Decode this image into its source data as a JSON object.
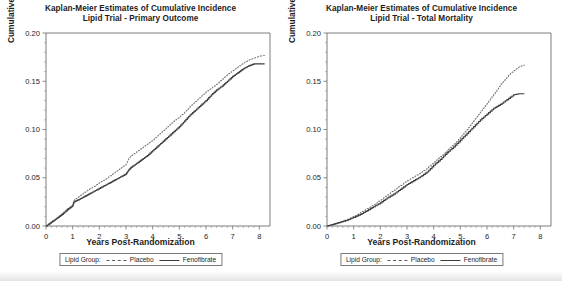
{
  "figure": {
    "panels": [
      {
        "id": "primary-outcome",
        "title_line1": "Kaplan-Meier Estimates of Cumulative Incidence",
        "title_line2": "Lipid Trial - Primary Outcome",
        "xlabel": "Years Post-Randomization",
        "ylabel": "Cumulative Incidence",
        "legend": {
          "title": "Lipid Group:",
          "entries": [
            {
              "label": "Placebo",
              "style": "dashed"
            },
            {
              "label": "Fenofibrate",
              "style": "solid"
            }
          ]
        }
      },
      {
        "id": "total-mortality",
        "title_line1": "Kaplan-Meier Estimates of Cumulative Incidence",
        "title_line2": "Lipid Trial - Total Mortality",
        "xlabel": "Years Post-Randomization",
        "ylabel": "Cumulative Incidence",
        "legend": {
          "title": "Lipid Group:",
          "entries": [
            {
              "label": "Placebo",
              "style": "dashed"
            },
            {
              "label": "Fenofibrate",
              "style": "solid"
            }
          ]
        }
      }
    ]
  },
  "chart_data": [
    {
      "type": "line",
      "id": "primary-outcome",
      "title": "Kaplan-Meier Estimates of Cumulative Incidence / Lipid Trial - Primary Outcome",
      "xlabel": "Years Post-Randomization",
      "ylabel": "Cumulative Incidence",
      "xlim": [
        0,
        8.4
      ],
      "ylim": [
        0,
        0.2
      ],
      "xticks": [
        0,
        1,
        2,
        3,
        4,
        5,
        6,
        7,
        8
      ],
      "yticks": [
        0.0,
        0.05,
        0.1,
        0.15,
        0.2
      ],
      "ytick_labels": [
        "0.00",
        "0.05",
        "0.10",
        "0.15",
        "0.20"
      ],
      "xtick_labels": [
        "0",
        "1",
        "2",
        "3",
        "4",
        "5",
        "6",
        "7",
        "8"
      ],
      "grid": false,
      "legend_position": "below-axes",
      "step": "post",
      "series": [
        {
          "name": "Placebo",
          "style": "dashed",
          "color": "#6a6a6a",
          "x": [
            0,
            0.2,
            0.4,
            0.6,
            0.8,
            1.0,
            1.05,
            1.2,
            1.4,
            1.6,
            1.8,
            2.0,
            2.2,
            2.4,
            2.6,
            2.8,
            3.0,
            3.1,
            3.2,
            3.4,
            3.6,
            3.8,
            4.0,
            4.2,
            4.4,
            4.6,
            4.8,
            5.0,
            5.2,
            5.4,
            5.6,
            5.8,
            6.0,
            6.2,
            6.4,
            6.6,
            6.8,
            7.0,
            7.2,
            7.4,
            7.6,
            7.8,
            8.0,
            8.2
          ],
          "y": [
            0.0,
            0.004,
            0.008,
            0.013,
            0.018,
            0.022,
            0.027,
            0.03,
            0.034,
            0.038,
            0.041,
            0.045,
            0.048,
            0.052,
            0.056,
            0.06,
            0.064,
            0.07,
            0.073,
            0.077,
            0.081,
            0.085,
            0.089,
            0.094,
            0.099,
            0.104,
            0.109,
            0.113,
            0.118,
            0.124,
            0.129,
            0.134,
            0.139,
            0.143,
            0.147,
            0.152,
            0.157,
            0.161,
            0.165,
            0.169,
            0.172,
            0.174,
            0.176,
            0.177
          ]
        },
        {
          "name": "Fenofibrate",
          "style": "solid",
          "color": "#3c3c3c",
          "x": [
            0,
            0.2,
            0.4,
            0.6,
            0.8,
            1.0,
            1.05,
            1.2,
            1.4,
            1.6,
            1.8,
            2.0,
            2.2,
            2.4,
            2.6,
            2.8,
            3.0,
            3.1,
            3.2,
            3.4,
            3.6,
            3.8,
            4.0,
            4.2,
            4.4,
            4.6,
            4.8,
            5.0,
            5.2,
            5.4,
            5.6,
            5.8,
            6.0,
            6.2,
            6.4,
            6.6,
            6.8,
            7.0,
            7.2,
            7.4,
            7.6,
            7.8,
            8.0,
            8.2
          ],
          "y": [
            0.0,
            0.004,
            0.008,
            0.012,
            0.017,
            0.021,
            0.025,
            0.027,
            0.03,
            0.033,
            0.036,
            0.039,
            0.042,
            0.045,
            0.048,
            0.051,
            0.054,
            0.058,
            0.061,
            0.065,
            0.069,
            0.073,
            0.078,
            0.083,
            0.088,
            0.093,
            0.098,
            0.103,
            0.109,
            0.115,
            0.12,
            0.125,
            0.13,
            0.136,
            0.141,
            0.145,
            0.15,
            0.155,
            0.159,
            0.163,
            0.166,
            0.168,
            0.168,
            0.168
          ]
        }
      ]
    },
    {
      "type": "line",
      "id": "total-mortality",
      "title": "Kaplan-Meier Estimates of Cumulative Incidence / Lipid Trial - Total Mortality",
      "xlabel": "Years Post-Randomization",
      "ylabel": "Cumulative Incidence",
      "xlim": [
        0,
        8.4
      ],
      "ylim": [
        0,
        0.2
      ],
      "xticks": [
        0,
        1,
        2,
        3,
        4,
        5,
        6,
        7,
        8
      ],
      "yticks": [
        0.0,
        0.05,
        0.1,
        0.15,
        0.2
      ],
      "ytick_labels": [
        "0.00",
        "0.05",
        "0.10",
        "0.15",
        "0.20"
      ],
      "xtick_labels": [
        "0",
        "1",
        "2",
        "3",
        "4",
        "5",
        "6",
        "7",
        "8"
      ],
      "grid": false,
      "legend_position": "below-axes",
      "step": "post",
      "series": [
        {
          "name": "Placebo",
          "style": "dashed",
          "color": "#6a6a6a",
          "x": [
            0,
            0.25,
            0.5,
            0.75,
            1.0,
            1.25,
            1.5,
            1.75,
            2.0,
            2.25,
            2.5,
            2.75,
            3.0,
            3.25,
            3.5,
            3.75,
            4.0,
            4.25,
            4.5,
            4.75,
            5.0,
            5.25,
            5.5,
            5.75,
            6.0,
            6.25,
            6.5,
            6.75,
            7.0,
            7.2,
            7.4
          ],
          "y": [
            0.0,
            0.002,
            0.004,
            0.007,
            0.01,
            0.014,
            0.018,
            0.022,
            0.027,
            0.032,
            0.037,
            0.042,
            0.047,
            0.051,
            0.055,
            0.06,
            0.066,
            0.072,
            0.078,
            0.085,
            0.092,
            0.1,
            0.109,
            0.118,
            0.127,
            0.137,
            0.147,
            0.155,
            0.161,
            0.165,
            0.167
          ]
        },
        {
          "name": "Fenofibrate",
          "style": "solid",
          "color": "#3c3c3c",
          "x": [
            0,
            0.25,
            0.5,
            0.75,
            1.0,
            1.25,
            1.5,
            1.75,
            2.0,
            2.25,
            2.5,
            2.75,
            3.0,
            3.25,
            3.5,
            3.75,
            4.0,
            4.25,
            4.5,
            4.75,
            5.0,
            5.25,
            5.5,
            5.75,
            6.0,
            6.25,
            6.5,
            6.75,
            7.0,
            7.2,
            7.4
          ],
          "y": [
            0.0,
            0.002,
            0.004,
            0.006,
            0.009,
            0.012,
            0.016,
            0.02,
            0.024,
            0.029,
            0.033,
            0.038,
            0.043,
            0.047,
            0.051,
            0.056,
            0.063,
            0.069,
            0.076,
            0.082,
            0.089,
            0.096,
            0.103,
            0.11,
            0.116,
            0.122,
            0.126,
            0.131,
            0.136,
            0.137,
            0.137
          ]
        }
      ]
    }
  ]
}
